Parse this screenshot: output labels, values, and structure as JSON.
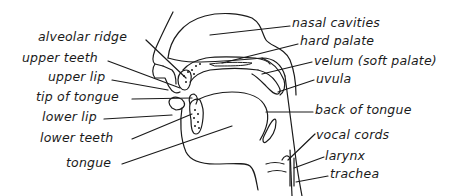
{
  "diagram": {
    "type": "anatomy-cross-section",
    "labels_left": [
      {
        "id": "alveolar-ridge",
        "text": "alveolar ridge"
      },
      {
        "id": "upper-teeth",
        "text": "upper teeth"
      },
      {
        "id": "upper-lip",
        "text": "upper lip"
      },
      {
        "id": "tip-of-tongue",
        "text": "tip of tongue"
      },
      {
        "id": "lower-lip",
        "text": "lower lip"
      },
      {
        "id": "lower-teeth",
        "text": "lower teeth"
      },
      {
        "id": "tongue",
        "text": "tongue"
      }
    ],
    "labels_right": [
      {
        "id": "nasal-cavities",
        "text": "nasal cavities"
      },
      {
        "id": "hard-palate",
        "text": "hard palate"
      },
      {
        "id": "velum",
        "text": "velum (soft palate)"
      },
      {
        "id": "uvula",
        "text": "uvula"
      },
      {
        "id": "back-of-tongue",
        "text": "back of tongue"
      },
      {
        "id": "vocal-cords",
        "text": "vocal cords"
      },
      {
        "id": "larynx",
        "text": "larynx"
      },
      {
        "id": "trachea",
        "text": "trachea"
      }
    ],
    "colors": {
      "ink": "#1a1a1a",
      "background": "#ffffff"
    }
  }
}
